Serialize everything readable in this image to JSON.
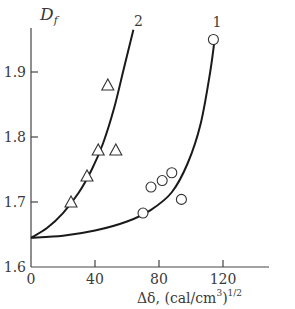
{
  "chart_data": {
    "type": "scatter",
    "title": "",
    "xlabel": "Δδ, (cal/cm³)¹ᐟ²",
    "xlabel_main": "Δδ, (cal/cm",
    "xlabel_sup1": "3",
    "xlabel_close": ")",
    "xlabel_sup2": "1/2",
    "ylabel": "D",
    "ylabel_sub": "f",
    "xlim": [
      0,
      145
    ],
    "ylim": [
      1.6,
      1.97
    ],
    "xticks": [
      "0",
      "40",
      "80",
      "120"
    ],
    "xtick_values": [
      0,
      40,
      80,
      120
    ],
    "yticks": [
      "1.6",
      "1.7",
      "1.8",
      "1.9"
    ],
    "ytick_values": [
      1.6,
      1.7,
      1.8,
      1.9
    ],
    "grid": false,
    "legend": "curve labels placed at line ends",
    "series": [
      {
        "name": "1",
        "marker": "circle",
        "points": [
          {
            "x": 70,
            "y": 1.683
          },
          {
            "x": 75,
            "y": 1.723
          },
          {
            "x": 82,
            "y": 1.733
          },
          {
            "x": 88,
            "y": 1.745
          },
          {
            "x": 94,
            "y": 1.704
          },
          {
            "x": 114,
            "y": 1.95
          }
        ],
        "curve": [
          {
            "x": 0,
            "y": 1.645
          },
          {
            "x": 20,
            "y": 1.648
          },
          {
            "x": 40,
            "y": 1.656
          },
          {
            "x": 60,
            "y": 1.67
          },
          {
            "x": 75,
            "y": 1.688
          },
          {
            "x": 88,
            "y": 1.715
          },
          {
            "x": 98,
            "y": 1.76
          },
          {
            "x": 106,
            "y": 1.82
          },
          {
            "x": 112,
            "y": 1.9
          },
          {
            "x": 115,
            "y": 1.955
          }
        ]
      },
      {
        "name": "2",
        "marker": "triangle",
        "points": [
          {
            "x": 25,
            "y": 1.7
          },
          {
            "x": 35,
            "y": 1.74
          },
          {
            "x": 42,
            "y": 1.78
          },
          {
            "x": 48,
            "y": 1.88
          },
          {
            "x": 53,
            "y": 1.78
          }
        ],
        "curve": [
          {
            "x": 0,
            "y": 1.645
          },
          {
            "x": 10,
            "y": 1.66
          },
          {
            "x": 20,
            "y": 1.683
          },
          {
            "x": 30,
            "y": 1.715
          },
          {
            "x": 38,
            "y": 1.75
          },
          {
            "x": 45,
            "y": 1.79
          },
          {
            "x": 52,
            "y": 1.845
          },
          {
            "x": 58,
            "y": 1.905
          },
          {
            "x": 64,
            "y": 1.965
          }
        ]
      }
    ]
  }
}
